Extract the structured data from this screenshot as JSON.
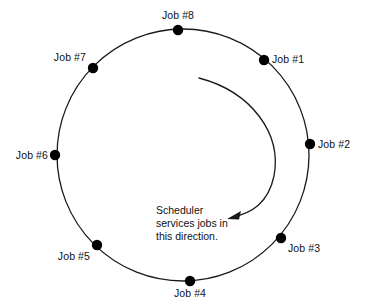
{
  "diagram": {
    "type": "circular-scheduler-ring",
    "stroke_color": "#1a1a1a",
    "node_color": "#000000",
    "background_color": "#ffffff",
    "circle": {
      "cx": 183,
      "cy": 155,
      "r": 126
    },
    "inner_arrow": {
      "description": "clockwise spiral arrow inside the ring",
      "start": {
        "x": 199,
        "y": 78
      },
      "end": {
        "x": 229,
        "y": 218
      },
      "direction": "clockwise"
    },
    "nodes": [
      {
        "label": "Job #1",
        "x": 264,
        "y": 60,
        "label_x": 272,
        "label_y": 54,
        "align": "left"
      },
      {
        "label": "Job #2",
        "x": 310,
        "y": 144,
        "label_x": 318,
        "label_y": 139,
        "align": "left"
      },
      {
        "label": "Job #3",
        "x": 281,
        "y": 238,
        "label_x": 288,
        "label_y": 243,
        "align": "left"
      },
      {
        "label": "Job #4",
        "x": 190,
        "y": 281,
        "label_x": 190,
        "label_y": 288,
        "align": "center"
      },
      {
        "label": "Job #5",
        "x": 97,
        "y": 245,
        "label_x": 90,
        "label_y": 251,
        "align": "right"
      },
      {
        "label": "Job #6",
        "x": 55,
        "y": 155,
        "label_x": 48,
        "label_y": 150,
        "align": "right"
      },
      {
        "label": "Job #7",
        "x": 93,
        "y": 68,
        "label_x": 86,
        "label_y": 52,
        "align": "right"
      },
      {
        "label": "Job #8",
        "x": 178,
        "y": 30,
        "label_x": 178,
        "label_y": 10,
        "align": "center"
      }
    ],
    "caption": {
      "lines": [
        "Scheduler",
        "services jobs in",
        "this direction."
      ]
    }
  }
}
